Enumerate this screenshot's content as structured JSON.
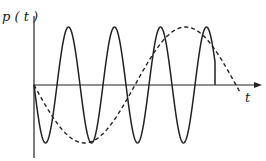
{
  "labels": {
    "y_axis": "p ( t )",
    "x_axis": "t"
  },
  "colors": {
    "line": "#222222"
  },
  "series": [
    {
      "name": "solid",
      "style": "solid",
      "x0": 34,
      "period": 46,
      "phase": "starts-at-zero-going-down",
      "end_x": 215
    },
    {
      "name": "dashed",
      "style": "dashed",
      "x0": 34,
      "period": 202,
      "phase": "starts-at-zero-going-down",
      "end_x": 240
    }
  ]
}
